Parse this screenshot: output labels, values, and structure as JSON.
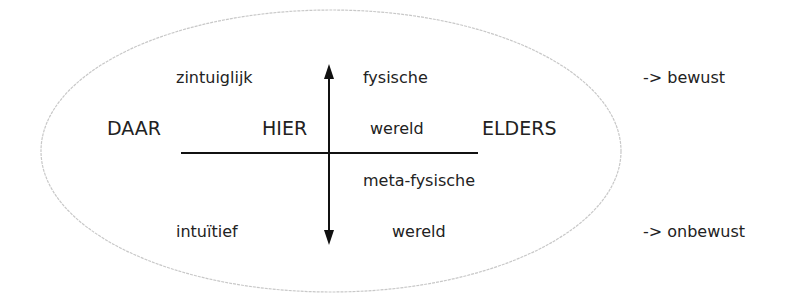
{
  "diagram": {
    "labels": {
      "zintuiglijk": "zintuiglijk",
      "fysische": "fysische",
      "daar": "DAAR",
      "hier": "HIER",
      "wereld_top": "wereld",
      "elders": "ELDERS",
      "meta_fysische": "meta-fysische",
      "intuitief": "intuïtief",
      "wereld_bottom": "wereld",
      "bewust": "-> bewust",
      "onbewust": "-> onbewust"
    },
    "colors": {
      "text": "#222222",
      "lines": "#111111",
      "ellipse": "#c8c8c8"
    }
  }
}
